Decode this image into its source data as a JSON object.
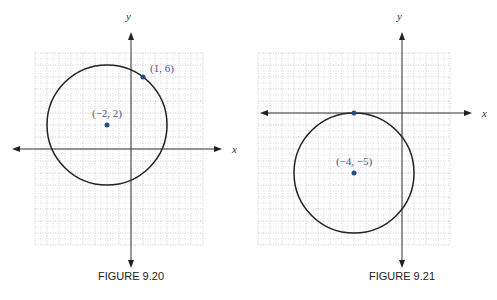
{
  "figures": [
    {
      "caption": "FIGURE 9.20",
      "x_label": "x",
      "y_label": "y",
      "grid_range": {
        "x": [
          -8,
          6
        ],
        "y": [
          -8,
          8
        ]
      },
      "circle": {
        "center": [
          -2,
          2
        ],
        "radius": 5
      },
      "points": [
        {
          "coords": [
            -2,
            2
          ],
          "label": "(−2, 2)"
        },
        {
          "coords": [
            1,
            6
          ],
          "label": "(1, 6)"
        }
      ],
      "point_color": "#2b4a8c"
    },
    {
      "caption": "FIGURE 9.21",
      "x_label": "x",
      "y_label": "y",
      "grid_range": {
        "x": [
          -12,
          4
        ],
        "y": [
          -11,
          5
        ]
      },
      "circle": {
        "center": [
          -4,
          -5
        ],
        "radius": 5
      },
      "points": [
        {
          "coords": [
            -4,
            -5
          ],
          "label": "(−4, −5)"
        },
        {
          "coords": [
            -4,
            0
          ],
          "label": ""
        }
      ],
      "point_color": "#2b4a8c"
    }
  ]
}
